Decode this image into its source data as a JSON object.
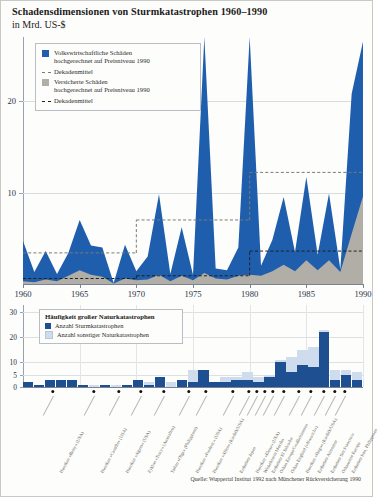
{
  "header": {
    "title": "Schadensdimensionen von Sturmkatastrophen 1960–1990",
    "subtitle": "in Mrd. US-$"
  },
  "legend_top": {
    "items": [
      {
        "swatch": "blue-square",
        "label": "Volkswirtschaftliche Schäden\nhochgerechnet auf Preisniveau 1990"
      },
      {
        "swatch": "grey-dashed-line",
        "label": "Dekadenmittel"
      },
      {
        "swatch": "grey-square",
        "label": "Versicherte Schäden\nhochgerechnet auf Preisniveau 1990"
      },
      {
        "swatch": "black-dashed-line",
        "label": "Dekadenmittel"
      }
    ]
  },
  "legend_bottom": {
    "title": "Häufigkeit großer Naturkatastrophen",
    "items": [
      {
        "swatch": "dark-blue-square",
        "label": "Anzahl Sturmkatastrophen"
      },
      {
        "swatch": "light-blue-square",
        "label": "Anzahl sonstiger Naturkatastrophen"
      }
    ]
  },
  "colors": {
    "economic_damage": "#1f5ead",
    "insured_damage": "#b0aea6",
    "storm_bars": "#1d4f91",
    "other_bars": "#cfdcee",
    "decade_mean_economic": "#7a7a74",
    "decade_mean_insured": "#20201c",
    "axis": "#7b8291",
    "grid": "#d8dbe0"
  },
  "source": "Quelle: Wuppertal Institut 1992 nach Münchener Rückversicherung 1990",
  "corner_mark": "",
  "chart_data": [
    {
      "type": "area",
      "id": "damage-area-chart",
      "title": "Schadensdimensionen von Sturmkatastrophen 1960–1990",
      "ylabel": "in Mrd. US-$",
      "xlabel": "",
      "xlim": [
        1960,
        1990
      ],
      "ylim": [
        0,
        27
      ],
      "yticks": [
        10,
        20
      ],
      "xticks": [
        1960,
        1965,
        1970,
        1975,
        1980,
        1985,
        1990
      ],
      "grid": true,
      "legend_position": "top-left",
      "x": [
        1960,
        1961,
        1962,
        1963,
        1964,
        1965,
        1966,
        1967,
        1968,
        1969,
        1970,
        1971,
        1972,
        1973,
        1974,
        1975,
        1976,
        1977,
        1978,
        1979,
        1980,
        1981,
        1982,
        1983,
        1984,
        1985,
        1986,
        1987,
        1988,
        1989,
        1990
      ],
      "series": [
        {
          "name": "Volkswirtschaftliche Schäden hochgerechnet auf Preisniveau 1990",
          "color": "#1f5ead",
          "values": [
            4.7,
            1.3,
            3.6,
            1.1,
            3.4,
            7.0,
            4.2,
            4.0,
            0.1,
            4.3,
            1.4,
            3.0,
            9.8,
            1.1,
            6.2,
            1.0,
            27.0,
            1.7,
            1.5,
            4.0,
            27.0,
            2.0,
            4.8,
            9.5,
            3.5,
            11.7,
            3.2,
            9.9,
            1.6,
            20.8,
            26.5
          ]
        },
        {
          "name": "Versicherte Schäden hochgerechnet auf Preisniveau 1990",
          "color": "#b0aea6",
          "values": [
            0.3,
            0.2,
            0.5,
            0.3,
            0.9,
            1.5,
            1.0,
            0.8,
            0.05,
            0.6,
            0.4,
            0.5,
            1.0,
            0.3,
            0.9,
            0.4,
            1.2,
            0.6,
            0.5,
            0.9,
            1.0,
            0.9,
            1.4,
            2.1,
            1.4,
            2.6,
            1.5,
            2.6,
            1.3,
            5.5,
            9.6
          ]
        }
      ],
      "decade_means": [
        {
          "name": "Dekadenmittel volkswirtschaftliche Schäden",
          "style": "dashed",
          "color": "#7a7a74",
          "segments": [
            {
              "from": 1960,
              "to": 1970,
              "value": 3.4
            },
            {
              "from": 1970,
              "to": 1980,
              "value": 7.0
            },
            {
              "from": 1980,
              "to": 1990,
              "value": 12.2
            }
          ]
        },
        {
          "name": "Dekadenmittel versicherte Schäden",
          "style": "dashed",
          "color": "#20201c",
          "segments": [
            {
              "from": 1960,
              "to": 1970,
              "value": 0.6
            },
            {
              "from": 1970,
              "to": 1980,
              "value": 0.9
            },
            {
              "from": 1980,
              "to": 1990,
              "value": 3.6
            }
          ]
        }
      ]
    },
    {
      "type": "bar",
      "id": "frequency-bar-chart",
      "title": "Häufigkeit großer Naturkatastrophen",
      "stacked": true,
      "xlim": [
        1960,
        1990
      ],
      "ylim": [
        0,
        33
      ],
      "yticks": [
        0,
        5,
        10,
        20,
        30
      ],
      "grid": true,
      "categories": [
        1960,
        1961,
        1962,
        1963,
        1964,
        1965,
        1966,
        1967,
        1968,
        1969,
        1970,
        1971,
        1972,
        1973,
        1974,
        1975,
        1976,
        1977,
        1978,
        1979,
        1980,
        1981,
        1982,
        1983,
        1984,
        1985,
        1986,
        1987,
        1988,
        1989,
        1990
      ],
      "series": [
        {
          "name": "Anzahl Sturmkatastrophen",
          "color": "#1d4f91",
          "values": [
            2,
            1,
            3,
            3,
            3,
            1,
            0,
            1,
            0,
            1,
            3,
            1,
            4,
            0,
            3,
            2,
            7,
            2,
            2,
            3,
            3,
            2,
            4,
            10,
            6,
            9,
            8,
            22,
            3,
            5,
            3
          ]
        },
        {
          "name": "Anzahl sonstiger Naturkatastrophen",
          "color": "#cfdcee",
          "values": [
            0,
            0,
            0,
            0,
            0,
            0,
            1,
            0,
            1,
            0,
            0,
            1,
            0,
            2,
            0,
            5,
            0,
            0,
            2,
            1,
            3,
            2,
            1,
            1,
            6,
            6,
            8,
            1,
            4,
            2,
            3
          ]
        }
      ]
    }
  ],
  "events": [
    {
      "year": 1965,
      "label": "Hurrikan »Betsy« (USA)"
    },
    {
      "year": 1969,
      "label": "Hurrikan »Camille« (USA)"
    },
    {
      "year": 1972,
      "label": "Hurrikan »Agnes« (USA)"
    },
    {
      "year": 1974,
      "label": "Zyklon »Tracy« (Australien)"
    },
    {
      "year": 1976,
      "label": "Taifun »Olga« (Philippinen)"
    },
    {
      "year": 1979,
      "label": "Hurrikan »Frederic« (USA)"
    },
    {
      "year": 1980,
      "label": "Hurrikan »Allen« (Karibik/USA)"
    },
    {
      "year": 1983,
      "label": "Erdbeben Japan"
    },
    {
      "year": 1987,
      "label": "Hurrikan »Elena« (USA)"
    },
    {
      "year": 1987,
      "label": "Wirbelsturm Mexiko"
    },
    {
      "year": 1987,
      "label": "Erdbeben El Salvador"
    },
    {
      "year": 1987,
      "label": "Orkan Europa/Großbritannien"
    },
    {
      "year": 1988,
      "label": "Orkan England (»Norwich«)"
    },
    {
      "year": 1989,
      "label": "Hurrikan »Hugo« (Karibik/USA)"
    },
    {
      "year": 1989,
      "label": "Erdbeben Armenien"
    },
    {
      "year": 1990,
      "label": "Erdbeben San Francisco"
    },
    {
      "year": 1990,
      "label": "Orkanserie Europa"
    },
    {
      "year": 1990,
      "label": "Erdbeben Iran, Philippinen"
    }
  ]
}
